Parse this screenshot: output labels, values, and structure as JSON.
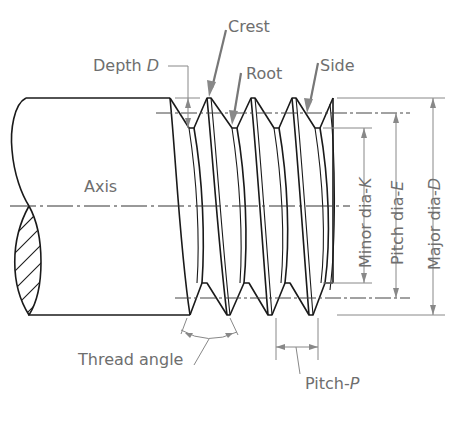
{
  "diagram": {
    "type": "screw-thread-nomenclature",
    "labels": {
      "crest": "Crest",
      "depth": "Depth ",
      "depth_var": "D",
      "root": "Root",
      "side": "Side",
      "axis": "Axis",
      "minor_dia": "Minor dia-",
      "minor_var": "K",
      "pitch_dia": "Pitch dia-",
      "pitch_var": "E",
      "major_dia": "Major dia-",
      "major_var": "D",
      "thread_angle": "Thread angle",
      "pitch": "Pitch-",
      "pitch_p_var": "P"
    },
    "colors": {
      "outline": "#1a1a1a",
      "annotation": "#6e6e6e",
      "background": "#ffffff"
    }
  }
}
